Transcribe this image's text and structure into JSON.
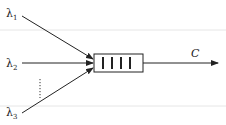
{
  "diagram": {
    "type": "queue-multiplexer",
    "inputs": [
      {
        "symbol": "λ",
        "subscript": "1"
      },
      {
        "symbol": "λ",
        "subscript": "2"
      },
      {
        "symbol": "λ",
        "subscript": "3"
      }
    ],
    "ellipsis": "vertical-dots",
    "queue_slots": 4,
    "output_label": "C",
    "colors": {
      "line": "#222222",
      "background": "#ffffff"
    }
  }
}
